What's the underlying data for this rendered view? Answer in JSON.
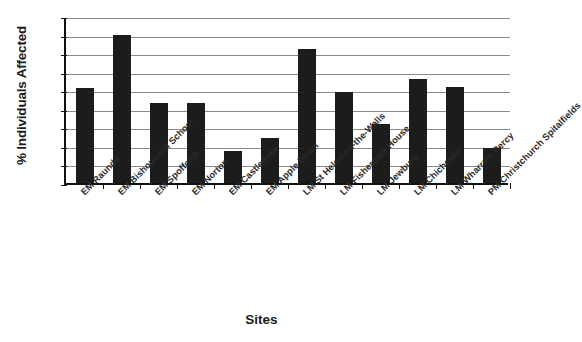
{
  "chart_data": {
    "type": "bar",
    "title": "",
    "xlabel": "Sites",
    "ylabel": "% Individuals Affected",
    "ylim": [
      0,
      90
    ],
    "ytick_step": 10,
    "yticks": [
      90,
      80,
      70,
      60,
      50,
      40,
      30,
      20,
      10,
      0
    ],
    "grid": true,
    "legend": null,
    "bar_color": "#1c1c1c",
    "categories": [
      "EM Raunds",
      "EM Bishopsmill School",
      "EM Spofforth",
      "EM Norton",
      "EM Castledyke",
      "EM Apple Down",
      "LM St Helen-on-the-Walls",
      "LM Fishergate House",
      "LM Jewbury",
      "LM Chichester",
      "LM Wharram Percy",
      "PM Christchurch Spitalfields"
    ],
    "values": [
      51,
      80,
      43,
      43,
      17,
      24,
      72,
      49,
      32,
      56,
      52,
      19
    ]
  }
}
